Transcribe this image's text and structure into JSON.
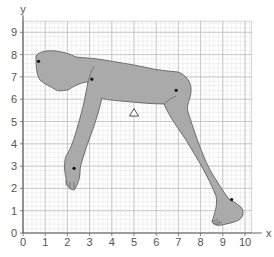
{
  "chart_data": {
    "type": "scatter",
    "title": "",
    "xlabel": "x",
    "ylabel": "y",
    "xlim": [
      0,
      10.3
    ],
    "ylim": [
      0,
      9.5
    ],
    "x_ticks": [
      "0",
      "1",
      "2",
      "3",
      "4",
      "5",
      "6",
      "7",
      "8",
      "9",
      "10"
    ],
    "y_ticks": [
      "0",
      "1",
      "2",
      "3",
      "4",
      "5",
      "6",
      "7",
      "8",
      "9"
    ],
    "grid": true,
    "grid_minor": true,
    "annotations": [
      "human figure silhouette in bent-over pose drawn on grid"
    ],
    "series": [
      {
        "name": "marked points",
        "marker": "dot",
        "points": [
          {
            "label": "head",
            "x": 0.7,
            "y": 7.7
          },
          {
            "label": "shoulder",
            "x": 3.1,
            "y": 6.9
          },
          {
            "label": "hip",
            "x": 6.9,
            "y": 6.4
          },
          {
            "label": "hand",
            "x": 2.3,
            "y": 2.9
          },
          {
            "label": "ankle",
            "x": 9.4,
            "y": 1.5
          }
        ]
      },
      {
        "name": "centre of mass",
        "marker": "triangle",
        "points": [
          {
            "label": "centroid",
            "x": 5.0,
            "y": 5.4
          }
        ]
      }
    ]
  },
  "colors": {
    "grid_major": "#b9b9b9",
    "grid_minor": "#e2e2e2",
    "figure_fill": "#aaaaaa",
    "figure_stroke": "#555555",
    "axis": "#666666"
  }
}
